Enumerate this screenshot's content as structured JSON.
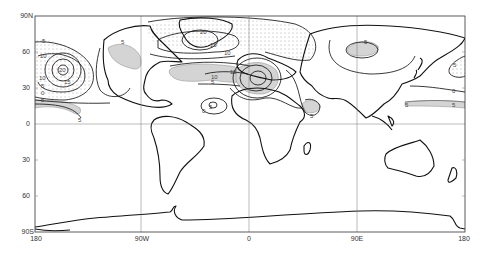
{
  "map": {
    "projection": "equirectangular",
    "extent": {
      "lon": [
        -180,
        180
      ],
      "lat": [
        -90,
        90
      ]
    },
    "x_ticks": [
      {
        "label": "180",
        "lon": -180
      },
      {
        "label": "90W",
        "lon": -90
      },
      {
        "label": "0",
        "lon": 0
      },
      {
        "label": "90E",
        "lon": 90
      },
      {
        "label": "180",
        "lon": 180
      }
    ],
    "y_ticks": [
      {
        "label": "90N",
        "lat": 90
      },
      {
        "label": "60",
        "lat": 60
      },
      {
        "label": "30",
        "lat": 30
      },
      {
        "label": "0",
        "lat": 0
      },
      {
        "label": "30",
        "lat": -30
      },
      {
        "label": "60",
        "lat": -60
      },
      {
        "label": "90S",
        "lat": -90
      }
    ],
    "contour_labels": [
      {
        "text": "5",
        "lon": -172,
        "lat": 67
      },
      {
        "text": "10",
        "lon": -173,
        "lat": 56
      },
      {
        "text": "20",
        "lon": -157,
        "lat": 45
      },
      {
        "text": "10",
        "lon": -174,
        "lat": 35
      },
      {
        "text": "15",
        "lon": -155,
        "lat": 33
      },
      {
        "text": "5",
        "lon": -174,
        "lat": 29
      },
      {
        "text": "0",
        "lon": -174,
        "lat": 24
      },
      {
        "text": "5",
        "lon": -174,
        "lat": 18
      },
      {
        "text": "5",
        "lon": -151,
        "lat": 3
      },
      {
        "text": "5",
        "lon": -102,
        "lat": 66
      },
      {
        "text": "20",
        "lon": -42,
        "lat": 77
      },
      {
        "text": "15",
        "lon": -38,
        "lat": 66
      },
      {
        "text": "10",
        "lon": -20,
        "lat": 57
      },
      {
        "text": "15",
        "lon": -14,
        "lat": 42
      },
      {
        "text": "10",
        "lon": -30,
        "lat": 37
      },
      {
        "text": "5",
        "lon": -32,
        "lat": 33
      },
      {
        "text": "0",
        "lon": -40,
        "lat": 9
      },
      {
        "text": "5",
        "lon": -32,
        "lat": 14
      },
      {
        "text": "5",
        "lon": 56,
        "lat": 7
      },
      {
        "text": "5",
        "lon": 100,
        "lat": 67
      },
      {
        "text": "5",
        "lon": 166,
        "lat": 46
      },
      {
        "text": "0",
        "lon": 164,
        "lat": 26
      },
      {
        "text": "5",
        "lon": 134,
        "lat": 15
      },
      {
        "text": "5",
        "lon": 165,
        "lat": 14
      }
    ]
  }
}
